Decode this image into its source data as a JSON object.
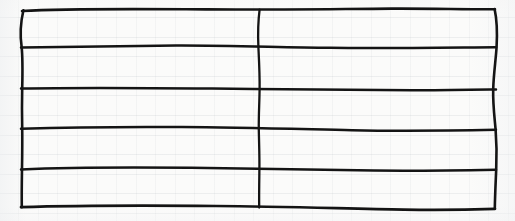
{
  "document": {
    "kind": "hand-drawn-table-sketch",
    "surface": "faint-ruled-graph-paper",
    "title": "Hand-drawn empty table grid",
    "description": "A freehand ink rectangle divided into 5 rows and 2 columns, drawn on lightly ruled notebook paper. All cells are blank.",
    "canvas": {
      "width": 515,
      "height": 221
    },
    "colors": {
      "paper": "#fbfbfa",
      "ink": "#141414",
      "ruling": "#8c96a0"
    }
  },
  "table": {
    "row_count": 5,
    "column_count": 2,
    "cells_filled": 0,
    "has_header_row": false,
    "bounds": {
      "left": 21,
      "top": 9,
      "right": 496,
      "bottom": 208
    },
    "column_divider_x": 259,
    "row_line_y": [
      9,
      47,
      89,
      128,
      168,
      208
    ],
    "rows": [
      {
        "index": 1,
        "cells": [
          "",
          ""
        ]
      },
      {
        "index": 2,
        "cells": [
          "",
          ""
        ]
      },
      {
        "index": 3,
        "cells": [
          "",
          ""
        ]
      },
      {
        "index": 4,
        "cells": [
          "",
          ""
        ]
      },
      {
        "index": 5,
        "cells": [
          "",
          ""
        ]
      }
    ],
    "strokes": {
      "border_top": "M 22 11 C 70 8.2, 140 9.0, 206 9.4 C 266 9.8, 330 9.0, 392 8.6 C 430 8.4, 468 9.4, 495 9.2",
      "rule_1": "M 21 47.4 C 62 46.6, 120 45.8, 176 45.6 C 226 45.4, 276 47.2, 330 47.8 C 386 48.4, 444 47.6, 496 47.2",
      "rule_2": "M 21 88.6 C 74 87.6, 146 88.0, 212 88.6 C 280 89.2, 350 90.0, 412 90.2 C 446 90.3, 472 89.8, 496 89.4",
      "rule_3": "M 21 128.8 C 62 127.4, 122 126.6, 182 127.0 C 238 127.4, 296 129.0, 352 130.2 C 400 131.2, 452 130.6, 496 129.8",
      "rule_4": "M 21 169.4 C 64 167.6, 128 167.2, 190 167.8 C 252 168.4, 314 170.0, 374 170.6 C 422 171.1, 462 170.4, 496 169.8",
      "rule_5": "M 21 207.2 C 72 205.6, 148 205.4, 216 206.0 C 282 206.6, 346 208.6, 404 209.6 C 442 210.2, 472 209.6, 495 208.8",
      "border_left": "M 23.4 10.2 C 20.2 24, 19.8 34, 21.6 46.6 C 22.8 58, 22.6 72, 22.2 88.2 C 21.8 106, 22.0 118, 22.2 128.4 C 22.4 142, 22.2 156, 22.0 168.8 C 21.8 182, 21.6 196, 21.8 207.2",
      "border_right": "M 494.6 9.0 C 497.0 20, 497.4 32, 496.6 46.8 C 495.8 60, 493.6 74, 493.2 89.2 C 492.8 104, 494.4 116, 495.6 129.4 C 496.6 142, 496.8 156, 496.2 169.6 C 495.6 184, 495.0 196, 494.8 208.4",
      "divider_middle": "M 259.6 9.6 C 258.0 22, 257.8 34, 258.4 47.4 C 259.0 60, 259.8 74, 259.6 88.8 C 259.4 104, 258.6 116, 258.8 128.8 C 259.0 142, 259.6 156, 259.4 169.2 C 259.2 184, 259.0 196, 259.2 207.6"
    }
  }
}
